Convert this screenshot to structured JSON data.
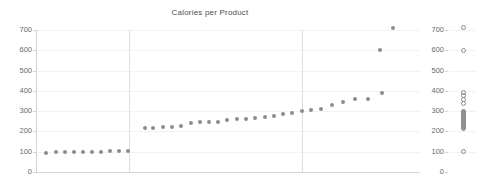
{
  "chart": {
    "title": "Calories per Product"
  },
  "axes": {
    "y_ticks": [
      "700",
      "600",
      "500",
      "400",
      "300",
      "200",
      "100",
      "0"
    ],
    "y_tick_values": [
      700,
      600,
      500,
      400,
      300,
      200,
      100,
      0
    ],
    "strip_y_ticks": [
      "700",
      "600",
      "500",
      "400",
      "300",
      "200",
      "100",
      "0"
    ]
  },
  "chart_data": {
    "type": "scatter",
    "title": "Calories per Product",
    "xlabel": "",
    "ylabel": "",
    "ylim": [
      0,
      700
    ],
    "yticks": [
      0,
      100,
      200,
      300,
      400,
      500,
      600,
      700
    ],
    "grid": true,
    "legend": "none",
    "marker": "filled-circle",
    "marker_color": "#8c8c8c",
    "panels": [
      {
        "name": "panel-1",
        "x": [
          1,
          2,
          3,
          4,
          5,
          6,
          7,
          8,
          9,
          10
        ],
        "y": [
          95,
          96,
          97,
          98,
          99,
          100,
          100,
          101,
          102,
          103
        ]
      },
      {
        "name": "panel-2",
        "x": [
          11,
          12,
          13,
          14,
          15,
          16,
          17,
          18,
          19,
          20,
          21,
          22
        ],
        "y": [
          215,
          218,
          220,
          222,
          225,
          240,
          243,
          245,
          248,
          255,
          258,
          262
        ]
      },
      {
        "name": "panel-3",
        "x": [
          23,
          24,
          25,
          26,
          27,
          28,
          29,
          30,
          31,
          32,
          33,
          34,
          35
        ],
        "y": [
          268,
          272,
          280,
          288,
          295,
          300,
          310,
          325,
          340,
          355,
          360,
          380,
          390
        ]
      }
    ],
    "outliers": [
      {
        "x": 34,
        "y": 600
      },
      {
        "x": 35,
        "y": 710
      }
    ],
    "strip_plot": {
      "type": "strip",
      "marker": "open-circle",
      "values": [
        100,
        100,
        100,
        100,
        100,
        100,
        100,
        100,
        100,
        100,
        215,
        220,
        225,
        240,
        245,
        255,
        260,
        265,
        270,
        275,
        280,
        285,
        290,
        295,
        300,
        310,
        325,
        340,
        355,
        360,
        380,
        390,
        600,
        710
      ],
      "dense_band": [
        220,
        300
      ]
    }
  },
  "series_points": {
    "main": [
      {
        "px": 0.024,
        "v": 95
      },
      {
        "px": 0.049,
        "v": 97
      },
      {
        "px": 0.073,
        "v": 98
      },
      {
        "px": 0.096,
        "v": 99
      },
      {
        "px": 0.12,
        "v": 100
      },
      {
        "px": 0.143,
        "v": 100
      },
      {
        "px": 0.167,
        "v": 101
      },
      {
        "px": 0.19,
        "v": 102
      },
      {
        "px": 0.214,
        "v": 102
      },
      {
        "px": 0.237,
        "v": 103
      },
      {
        "px": 0.281,
        "v": 215
      },
      {
        "px": 0.304,
        "v": 218
      },
      {
        "px": 0.328,
        "v": 220
      },
      {
        "px": 0.352,
        "v": 222
      },
      {
        "px": 0.375,
        "v": 225
      },
      {
        "px": 0.401,
        "v": 243
      },
      {
        "px": 0.425,
        "v": 245
      },
      {
        "px": 0.448,
        "v": 246
      },
      {
        "px": 0.472,
        "v": 248
      },
      {
        "px": 0.497,
        "v": 258
      },
      {
        "px": 0.521,
        "v": 260
      },
      {
        "px": 0.545,
        "v": 262
      },
      {
        "px": 0.57,
        "v": 268
      },
      {
        "px": 0.594,
        "v": 272
      },
      {
        "px": 0.618,
        "v": 278
      },
      {
        "px": 0.642,
        "v": 285
      },
      {
        "px": 0.667,
        "v": 292
      },
      {
        "px": 0.691,
        "v": 300
      },
      {
        "px": 0.716,
        "v": 305
      },
      {
        "px": 0.742,
        "v": 312
      },
      {
        "px": 0.771,
        "v": 330
      },
      {
        "px": 0.8,
        "v": 345
      },
      {
        "px": 0.831,
        "v": 358
      },
      {
        "px": 0.865,
        "v": 360
      },
      {
        "px": 0.9,
        "v": 390
      },
      {
        "px": 0.896,
        "v": 600
      },
      {
        "px": 0.93,
        "v": 710
      }
    ],
    "strip": [
      {
        "v": 710,
        "off": 0
      },
      {
        "v": 600,
        "off": 0
      },
      {
        "v": 390,
        "off": 0
      },
      {
        "v": 375,
        "off": 0
      },
      {
        "v": 358,
        "off": 0
      },
      {
        "v": 340,
        "off": 0
      },
      {
        "v": 300,
        "off": 0
      },
      {
        "v": 292,
        "off": 0
      },
      {
        "v": 285,
        "off": 0
      },
      {
        "v": 278,
        "off": 0
      },
      {
        "v": 272,
        "off": 0
      },
      {
        "v": 265,
        "off": 0
      },
      {
        "v": 258,
        "off": 0
      },
      {
        "v": 250,
        "off": 0
      },
      {
        "v": 243,
        "off": 0
      },
      {
        "v": 236,
        "off": 0
      },
      {
        "v": 228,
        "off": 0
      },
      {
        "v": 220,
        "off": 0
      },
      {
        "v": 212,
        "off": 0
      },
      {
        "v": 100,
        "off": 0
      }
    ]
  }
}
